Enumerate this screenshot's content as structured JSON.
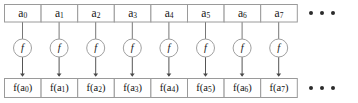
{
  "figure": {
    "colors": {
      "box_stroke": "#9a9a9a",
      "box_fill": "#ffffff",
      "circle_stroke": "#a0a0a0",
      "arrow": "#555555",
      "text": "#141414",
      "background": "#ffffff"
    }
  },
  "input_row": {
    "name": "input-array",
    "cells": [
      {
        "base": "a",
        "sub": "0",
        "text": "a0"
      },
      {
        "base": "a",
        "sub": "1",
        "text": "a1"
      },
      {
        "base": "a",
        "sub": "2",
        "text": "a2"
      },
      {
        "base": "a",
        "sub": "3",
        "text": "a3"
      },
      {
        "base": "a",
        "sub": "4",
        "text": "a4"
      },
      {
        "base": "a",
        "sub": "5",
        "text": "a5"
      },
      {
        "base": "a",
        "sub": "6",
        "text": "a6"
      },
      {
        "base": "a",
        "sub": "7",
        "text": "a7"
      }
    ],
    "ellipsis": "• • •"
  },
  "function_row": {
    "name": "function-nodes",
    "label": "f",
    "nodes": [
      {
        "label": "f"
      },
      {
        "label": "f"
      },
      {
        "label": "f"
      },
      {
        "label": "f"
      },
      {
        "label": "f"
      },
      {
        "label": "f"
      },
      {
        "label": "f"
      },
      {
        "label": "f"
      }
    ]
  },
  "output_row": {
    "name": "output-array",
    "cells": [
      {
        "prefix": "f(a",
        "sub": "0",
        "suffix": ")",
        "text": "f(a0)"
      },
      {
        "prefix": "f(a",
        "sub": "1",
        "suffix": ")",
        "text": "f(a1)"
      },
      {
        "prefix": "f(a",
        "sub": "2",
        "suffix": ")",
        "text": "f(a2)"
      },
      {
        "prefix": "f(a",
        "sub": "3",
        "suffix": ")",
        "text": "f(a3)"
      },
      {
        "prefix": "f(a",
        "sub": "4",
        "suffix": ")",
        "text": "f(a4)"
      },
      {
        "prefix": "f(a",
        "sub": "5",
        "suffix": ")",
        "text": "f(a5)"
      },
      {
        "prefix": "f(a",
        "sub": "6",
        "suffix": ")",
        "text": "f(a6)"
      },
      {
        "prefix": "f(a",
        "sub": "7",
        "suffix": ")",
        "text": "f(a7)"
      }
    ],
    "ellipsis": "• • •"
  }
}
